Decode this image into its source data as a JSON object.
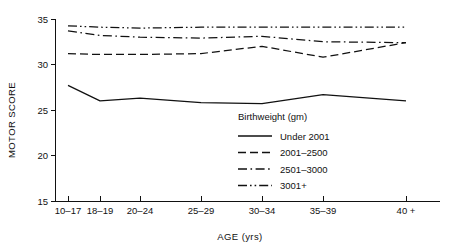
{
  "chart_data": {
    "type": "line",
    "title": "",
    "xlabel": "AGE (yrs)",
    "ylabel": "MOTOR SCORE",
    "categories": [
      "10-17",
      "18-19",
      "20-24",
      "25-29",
      "30-34",
      "35-39",
      "40+"
    ],
    "x_tick_labels": [
      "10–17",
      "18–19",
      "20–24",
      "25–29",
      "30–34",
      "35–39",
      "40 +"
    ],
    "y_tick_labels": [
      "15",
      "20",
      "25",
      "30",
      "35"
    ],
    "y_ticks": [
      15,
      20,
      25,
      30,
      35
    ],
    "ylim": [
      15,
      35
    ],
    "grid": false,
    "legend_position": "inside-lower-right",
    "legend_title": "Birthweight (gm)",
    "series": [
      {
        "name": "Under 2001",
        "style": "solid",
        "values": [
          27.7,
          26.0,
          26.3,
          25.8,
          25.7,
          26.7,
          26.0
        ]
      },
      {
        "name": "2001–2500",
        "style": "dashed",
        "values": [
          31.2,
          31.1,
          31.1,
          31.2,
          32.0,
          30.8,
          32.4
        ]
      },
      {
        "name": "2501–3000",
        "style": "dash-dot",
        "values": [
          33.7,
          33.2,
          33.0,
          32.9,
          33.1,
          32.5,
          32.4
        ]
      },
      {
        "name": "3001+",
        "style": "dash-dot-dot",
        "values": [
          34.25,
          34.1,
          34.0,
          34.1,
          34.1,
          34.1,
          34.1
        ]
      }
    ],
    "colors": {
      "axis": "#111111",
      "series": "#111111",
      "background": "#ffffff"
    }
  },
  "legend": {
    "title": "Birthweight (gm)",
    "items": [
      {
        "label": "Under 2001",
        "style": "solid"
      },
      {
        "label": "2001–2500",
        "style": "dashed"
      },
      {
        "label": "2501–3000",
        "style": "dash-dot"
      },
      {
        "label": "3001+",
        "style": "dash-dot-dot"
      }
    ]
  },
  "axes": {
    "x_title": "AGE (yrs)",
    "y_title": "MOTOR SCORE"
  }
}
